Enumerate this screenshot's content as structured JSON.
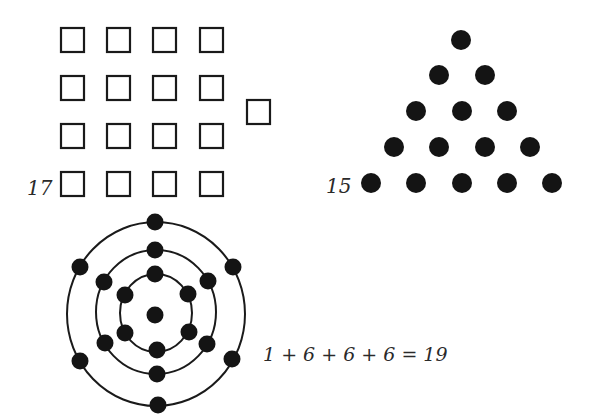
{
  "figures": {
    "square_grid": {
      "label": "17",
      "description": "4x4 grid of squares plus one extra square",
      "rows": 4,
      "cols": 4,
      "extra": 1
    },
    "triangle": {
      "label": "15",
      "description": "triangular arrangement of dots, rows 1-5",
      "rows": [
        1,
        2,
        3,
        4,
        5
      ]
    },
    "hexagonal": {
      "label": "1 + 6 + 6 + 6 = 19",
      "description": "center dot with three concentric rings of 6 dots each",
      "center": 1,
      "rings": [
        6,
        6,
        6
      ]
    }
  },
  "colors": {
    "stroke": "#1a1a1a",
    "dot": "#141414",
    "background": "#ffffff"
  }
}
